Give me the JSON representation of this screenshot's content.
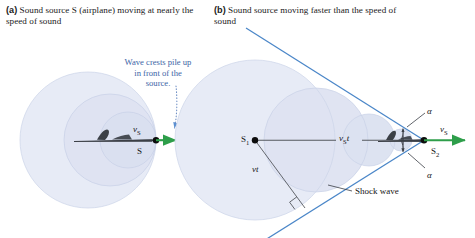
{
  "figure": {
    "background_color": "#ffffff",
    "wave_circle_color": "#e3e7f3",
    "cone_line_color": "#4a86c8",
    "velocity_arrow_color": "#2e9e4a",
    "annotation_text_color": "#3c64a6",
    "airplane_color": "#3b3f46"
  },
  "panel_a": {
    "label": "(a)",
    "caption_line1": "Sound source S (airplane) moving",
    "caption_line2": "at nearly the speed of sound",
    "annotation": {
      "line1": "Wave crests pile up",
      "line2": "in front of the",
      "line3": "source.",
      "leader": "dotted-leader-line"
    },
    "source_label": "S",
    "velocity_label": "v",
    "velocity_sub": "S",
    "wave_circles": [
      {
        "cx": 88,
        "cy": 140,
        "r": 68
      },
      {
        "cx": 110,
        "cy": 140,
        "r": 46
      },
      {
        "cx": 128,
        "cy": 140,
        "r": 28
      }
    ],
    "source_point": {
      "x": 156,
      "y": 140
    }
  },
  "panel_b": {
    "label": "(b)",
    "caption_line1": "Sound source moving faster",
    "caption_line2": "than the speed of sound",
    "source_start_label": "S",
    "source_start_sub": "1",
    "source_end_label": "S",
    "source_end_sub": "2",
    "distance_source_label": "v",
    "distance_source_sub": "S",
    "distance_source_time": "t",
    "distance_wave_label": "vt",
    "angle_label_top": "α",
    "angle_label_bottom": "α",
    "velocity_label": "v",
    "velocity_sub": "S",
    "shock_wave_label": "Shock wave",
    "right_angle_marker": true,
    "source_start_point": {
      "x": 255,
      "y": 140
    },
    "source_end_point": {
      "x": 424,
      "y": 140
    },
    "wave_circles": [
      {
        "cx": 255,
        "cy": 140,
        "r": 80
      },
      {
        "cx": 315,
        "cy": 140,
        "r": 52
      },
      {
        "cx": 368,
        "cy": 140,
        "r": 26
      },
      {
        "cx": 400,
        "cy": 140,
        "r": 11
      }
    ]
  }
}
